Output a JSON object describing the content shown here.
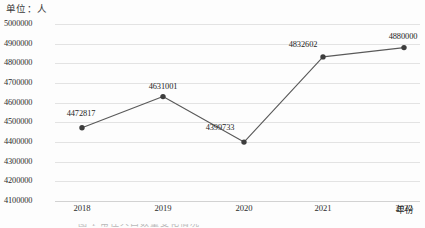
{
  "unit_label": "单位：人",
  "chart_data": {
    "type": "line",
    "title": "",
    "xlabel": "年份",
    "ylabel": "单位：人",
    "categories": [
      "2018",
      "2019",
      "2020",
      "2021",
      "2022"
    ],
    "values": [
      4472817,
      4631001,
      4399733,
      4832602,
      4880000
    ],
    "point_labels": [
      "4472817",
      "4631001",
      "4399733",
      "4832602",
      "4880000"
    ],
    "ylim": [
      4100000,
      5000000
    ],
    "ytick_step": 100000,
    "yticks": [
      "5000000",
      "4900000",
      "4800000",
      "4700000",
      "4600000",
      "4500000",
      "4400000",
      "4300000",
      "4200000",
      "4100000"
    ],
    "grid": true,
    "legend": "none",
    "series_color": "#595959",
    "marker_color": "#3d3d3d",
    "grid_color": "#e3e3e3"
  },
  "caption": {
    "text": "图 1 常住人口数量变化情况"
  }
}
